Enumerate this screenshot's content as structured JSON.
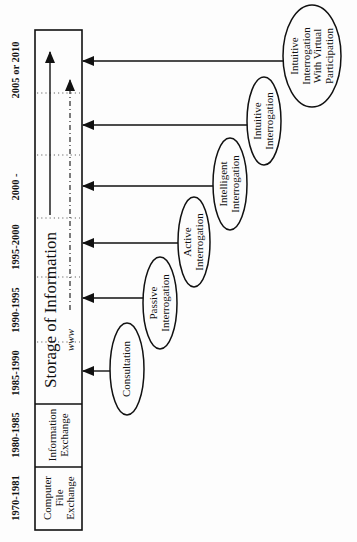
{
  "diagram": {
    "years": [
      {
        "label": "1970-1981",
        "y": 498
      },
      {
        "label": "1980-1985",
        "y": 435
      },
      {
        "label": "1985-1990",
        "y": 373
      },
      {
        "label": "1990-1995",
        "y": 310
      },
      {
        "label": "1995-2000",
        "y": 247
      },
      {
        "label": "2000 -",
        "y": 187
      },
      {
        "label": "2005 or 2010",
        "y": 70
      }
    ],
    "cells": {
      "computer_file_exchange": [
        "Computer",
        "File",
        "Exchange"
      ],
      "information_exchange": [
        "Information",
        "Exchange"
      ]
    },
    "storage_label": "Storage of Information",
    "www_label": "www",
    "stages": [
      {
        "id": "consultation",
        "lines": [
          "Consultation"
        ]
      },
      {
        "id": "passive",
        "lines": [
          "Passive",
          "Interrogation"
        ]
      },
      {
        "id": "active",
        "lines": [
          "Active",
          "Interrogation"
        ]
      },
      {
        "id": "intelligent",
        "lines": [
          "Intelligent",
          "Interrogation"
        ]
      },
      {
        "id": "intuitive",
        "lines": [
          "Intuitive",
          "Interrogation"
        ]
      },
      {
        "id": "virtual",
        "lines": [
          "Intuitive",
          "Interrogation",
          "With Virtual",
          "Participation"
        ]
      }
    ],
    "colors": {
      "ink": "#111111",
      "background": "#fdfdfd"
    }
  }
}
